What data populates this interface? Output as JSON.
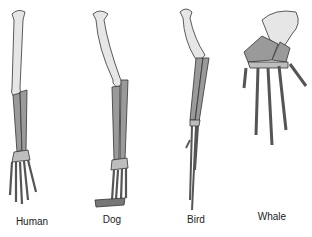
{
  "diagram": {
    "colors": {
      "upper_bone": "#e6e6e6",
      "lower_bone": "#9a9a9a",
      "outline": "#333333",
      "background": "#ffffff"
    },
    "limbs": [
      {
        "id": "human",
        "label": "Human"
      },
      {
        "id": "dog",
        "label": "Dog"
      },
      {
        "id": "bird",
        "label": "Bird"
      },
      {
        "id": "whale",
        "label": "Whale"
      }
    ]
  }
}
